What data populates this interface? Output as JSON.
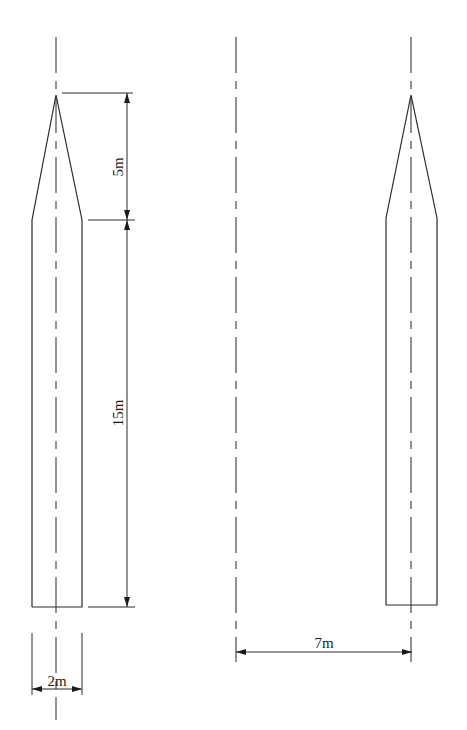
{
  "diagram": {
    "type": "engineering-drawing",
    "left_shape": {
      "tip_length_label": "5m",
      "body_length_label": "15m",
      "width_label": "2m"
    },
    "spacing": {
      "label": "7m"
    },
    "colors": {
      "line": "#2a2a2a",
      "background": "#ffffff"
    }
  }
}
